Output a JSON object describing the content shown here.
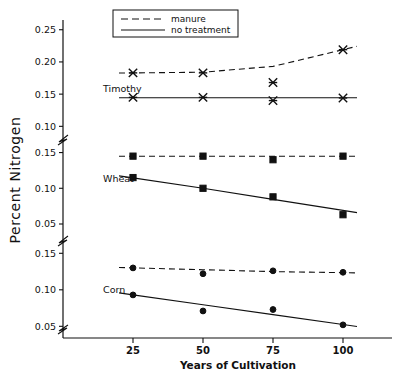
{
  "chart_data": {
    "type": "line",
    "title": "",
    "xlabel": "Years of Cultivation",
    "ylabel": "Percent Nitrogen",
    "x": [
      25,
      50,
      75,
      100
    ],
    "xtick_labels": [
      "25",
      "50",
      "75",
      "100"
    ],
    "xlim": [
      10,
      112
    ],
    "grid": false,
    "legend_position": "top-center",
    "legend": [
      {
        "label": "manure",
        "style": "dashed"
      },
      {
        "label": "no treatment",
        "style": "solid"
      }
    ],
    "broken_axis": true,
    "panels": [
      {
        "name": "Timothy",
        "label": "Timothy",
        "ylim": [
          0.085,
          0.262
        ],
        "ytick_labels": [
          "0.25",
          "0.20",
          "0.15",
          "0.10"
        ],
        "yticks": [
          0.25,
          0.2,
          0.15,
          0.1
        ],
        "marker": "x",
        "series": [
          {
            "name": "manure",
            "style": "dashed",
            "values": [
              0.183,
              0.183,
              0.168,
              0.219
            ],
            "fit": [
              0.183,
              0.184,
              0.193,
              0.219
            ]
          },
          {
            "name": "no treatment",
            "style": "solid",
            "values": [
              0.145,
              0.145,
              0.14,
              0.144
            ],
            "fit": [
              0.1445,
              0.1445,
              0.1445,
              0.1445
            ]
          }
        ]
      },
      {
        "name": "Wheat",
        "label": "Wheat",
        "ylim": [
          0.036,
          0.162
        ],
        "ytick_labels": [
          "0.15",
          "0.10",
          "0.05"
        ],
        "yticks": [
          0.15,
          0.1,
          0.05
        ],
        "marker": "square",
        "series": [
          {
            "name": "manure",
            "style": "dashed",
            "values": [
              0.145,
              0.145,
              0.14,
              0.145
            ],
            "fit": [
              0.1448,
              0.1448,
              0.1448,
              0.1448
            ]
          },
          {
            "name": "no treatment",
            "style": "solid",
            "values": [
              0.115,
              0.1,
              0.088,
              0.063
            ],
            "fit": [
              0.1145,
              0.1,
              0.0845,
              0.069
            ]
          }
        ]
      },
      {
        "name": "Corn",
        "label": "Corn",
        "ylim": [
          0.034,
          0.16
        ],
        "ytick_labels": [
          "0.15",
          "0.10",
          "0.05"
        ],
        "yticks": [
          0.15,
          0.1,
          0.05
        ],
        "marker": "circle",
        "series": [
          {
            "name": "manure",
            "style": "dashed",
            "values": [
              0.13,
              0.122,
              0.126,
              0.124
            ],
            "fit": [
              0.13,
              0.1275,
              0.125,
              0.1235
            ]
          },
          {
            "name": "no treatment",
            "style": "solid",
            "values": [
              0.093,
              0.071,
              0.073,
              0.052
            ],
            "fit": [
              0.093,
              0.0795,
              0.066,
              0.0525
            ]
          }
        ]
      }
    ]
  }
}
